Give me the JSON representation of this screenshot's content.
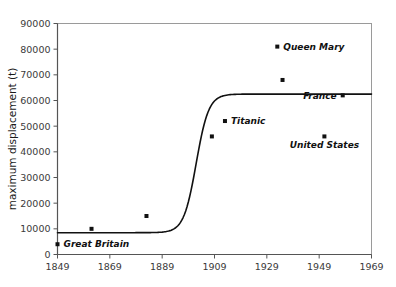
{
  "chart_data": {
    "type": "scatter",
    "title": "",
    "subtitle": "",
    "xlabel": "",
    "ylabel": "maximum displacement (t)",
    "xlim": [
      1849,
      1969
    ],
    "ylim": [
      0,
      90000
    ],
    "grid": false,
    "legend": false,
    "xticks": [
      "1849",
      "1869",
      "1889",
      "1909",
      "1929",
      "1949",
      "1969"
    ],
    "xtick_values": [
      1849,
      1869,
      1889,
      1909,
      1929,
      1949,
      1969
    ],
    "yticks": [
      "0",
      "10000",
      "20000",
      "30000",
      "40000",
      "50000",
      "60000",
      "70000",
      "80000",
      "90000"
    ],
    "ytick_values": [
      0,
      10000,
      20000,
      30000,
      40000,
      50000,
      60000,
      70000,
      80000,
      90000
    ],
    "points": [
      {
        "name": "Great Britain",
        "x": 1849,
        "y": 4000,
        "label": "Great Britain",
        "label_pos": "right"
      },
      {
        "name": "point-1862",
        "x": 1862,
        "y": 10000,
        "label": "",
        "label_pos": ""
      },
      {
        "name": "point-1883",
        "x": 1883,
        "y": 15000,
        "label": "",
        "label_pos": ""
      },
      {
        "name": "point-1908",
        "x": 1908,
        "y": 46000,
        "label": "",
        "label_pos": ""
      },
      {
        "name": "Titanic",
        "x": 1913,
        "y": 52000,
        "label": "Titanic",
        "label_pos": "right"
      },
      {
        "name": "Queen Mary",
        "x": 1933,
        "y": 81000,
        "label": "Queen Mary",
        "label_pos": "right"
      },
      {
        "name": "point-1935",
        "x": 1935,
        "y": 68000,
        "label": "",
        "label_pos": ""
      },
      {
        "name": "France",
        "x": 1958,
        "y": 62000,
        "label": "France",
        "label_pos": "left"
      },
      {
        "name": "United States",
        "x": 1951,
        "y": 46000,
        "label": "United States",
        "label_pos": "below"
      }
    ],
    "curve": {
      "name": "logistic-trend-curve",
      "description": "sigmoid growth curve",
      "lower_asymptote": 8500,
      "upper_asymptote": 62500,
      "midpoint_year": 1902,
      "steepness": 0.42,
      "color": "#111111"
    },
    "colors": {
      "point": "#111111",
      "curve": "#111111",
      "axis": "#555555",
      "frame": "#8a8a8a",
      "text": "#1a1a1a",
      "background": "#ffffff"
    }
  }
}
